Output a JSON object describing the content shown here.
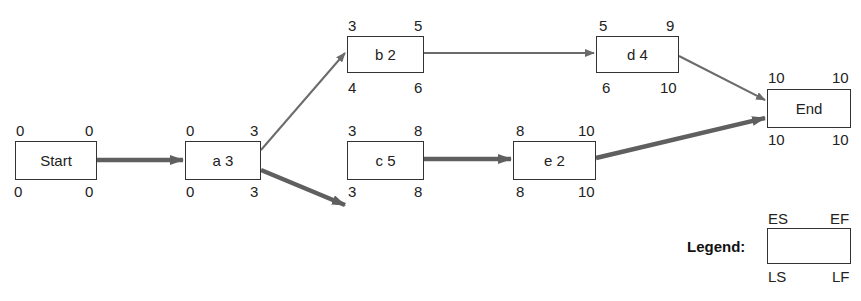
{
  "colors": {
    "edge": "#6b6b6b",
    "critical_edge": "#5f5f5f",
    "box_border": "#333333"
  },
  "nodes": [
    {
      "id": "start",
      "label": "Start",
      "ES": "0",
      "EF": "0",
      "LS": "0",
      "LF": "0",
      "x": 15,
      "y": 141,
      "w": 82,
      "h": 39
    },
    {
      "id": "a",
      "label": "a 3",
      "ES": "0",
      "EF": "3",
      "LS": "0",
      "LF": "3",
      "x": 185,
      "y": 141,
      "w": 76,
      "h": 39
    },
    {
      "id": "b",
      "label": "b 2",
      "ES": "3",
      "EF": "5",
      "LS": "4",
      "LF": "6",
      "x": 347,
      "y": 36,
      "w": 77,
      "h": 37
    },
    {
      "id": "c",
      "label": "c 5",
      "ES": "3",
      "EF": "8",
      "LS": "3",
      "LF": "8",
      "x": 347,
      "y": 141,
      "w": 77,
      "h": 39
    },
    {
      "id": "d",
      "label": "d 4",
      "ES": "5",
      "EF": "9",
      "LS": "6",
      "LF": "10",
      "x": 596,
      "y": 36,
      "w": 83,
      "h": 37
    },
    {
      "id": "e",
      "label": "e 2",
      "ES": "8",
      "EF": "10",
      "LS": "8",
      "LF": "10",
      "x": 513,
      "y": 141,
      "w": 83,
      "h": 39
    },
    {
      "id": "end",
      "label": "End",
      "ES": "10",
      "EF": "10",
      "LS": "10",
      "LF": "10",
      "x": 767,
      "y": 89,
      "w": 84,
      "h": 39
    }
  ],
  "edges": [
    {
      "from": "start",
      "to": "a",
      "critical": true
    },
    {
      "from": "a",
      "to": "b",
      "critical": false
    },
    {
      "from": "a",
      "to": "c",
      "critical": true
    },
    {
      "from": "b",
      "to": "d",
      "critical": false
    },
    {
      "from": "c",
      "to": "e",
      "critical": true
    },
    {
      "from": "d",
      "to": "end",
      "critical": false
    },
    {
      "from": "e",
      "to": "end",
      "critical": true
    }
  ],
  "legend": {
    "title": "Legend:",
    "ES": "ES",
    "EF": "EF",
    "LS": "LS",
    "LF": "LF"
  }
}
